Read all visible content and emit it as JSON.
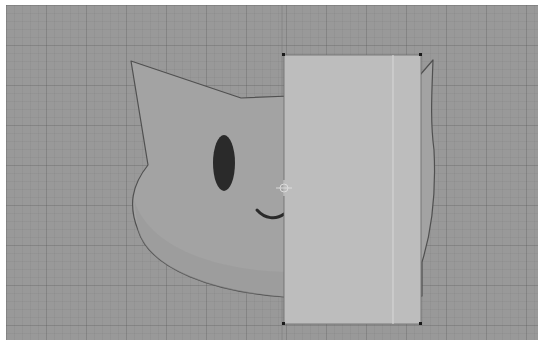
{
  "canvas": {
    "background": "#999999",
    "page_background": "#ffffff",
    "bounds": {
      "x": 6,
      "y": 5,
      "width": 532,
      "height": 335
    },
    "grid": {
      "minor": 8,
      "major": 40
    },
    "guide_x": 282
  },
  "artwork": {
    "label": "Cat head drawing",
    "head": {
      "fill": "#a3a3a3",
      "stroke": "#505050",
      "shade": "#9a9a9a"
    },
    "eye": {
      "cx": 224,
      "cy": 163,
      "rx": 11,
      "ry": 28,
      "fill": "#2a2a2a"
    },
    "smile": {
      "stroke": "#2a2a2a"
    }
  },
  "selection": {
    "label": "Selected rectangle",
    "x": 284,
    "y": 55,
    "width": 137,
    "height": 269,
    "fill": "#bdbdbd",
    "inner_line_x": 393,
    "handle_color": "#1a1a1a"
  },
  "pivot": {
    "label": "Pivot crosshair",
    "x": 284,
    "y": 188
  }
}
